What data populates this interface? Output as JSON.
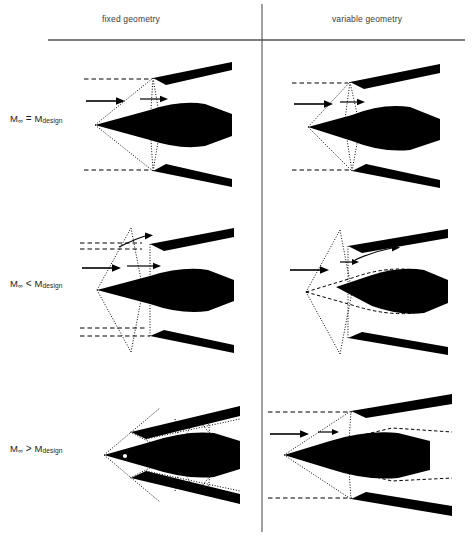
{
  "figure": {
    "columns": [
      {
        "id": "fixed",
        "label": "fixed geometry"
      },
      {
        "id": "variable",
        "label": "variable geometry"
      }
    ],
    "rows": [
      {
        "id": "design",
        "symbol": "M",
        "subscript": "∞",
        "operator": "=",
        "reference": "M",
        "reference_subscript": "design"
      },
      {
        "id": "below",
        "symbol": "M",
        "subscript": "∞",
        "operator": "<",
        "reference": "M",
        "reference_subscript": "design"
      },
      {
        "id": "above",
        "symbol": "M",
        "subscript": "∞",
        "operator": ">",
        "reference": "M",
        "reference_subscript": "design"
      }
    ],
    "row_labels": [
      "M∞ = Mdesign",
      "M∞ < Mdesign",
      "M∞ > Mdesign"
    ],
    "separators": {
      "vertical_x": 262,
      "horizontal_y": 40,
      "horizontal_x_start": 48,
      "horizontal_x_end": 465,
      "color": "#555555"
    },
    "colors": {
      "ink": "#000000",
      "body_fill": "#000000",
      "rule": "#555555",
      "header_text": "#3a3a3a",
      "label_text": "#1d1d1d",
      "background": "#ffffff"
    },
    "line_styles": {
      "shock_wave": "dotted",
      "freestream_streamline": "dashed",
      "ghost_original_position": "dashed",
      "flow_direction": "solid-arrow"
    },
    "cells": [
      {
        "row": "design",
        "column": "fixed",
        "description": "Oblique shock from centerbody tip impinges exactly on the cowl lip; shocks captured, no spillage.",
        "shock_on_lip": true,
        "spillage": false,
        "centerbody_translated": false
      },
      {
        "row": "design",
        "column": "variable",
        "description": "Oblique shock from centerbody tip impinges exactly on the cowl lip; shocks captured, no spillage.",
        "shock_on_lip": true,
        "spillage": false,
        "centerbody_translated": false
      },
      {
        "row": "below",
        "column": "fixed",
        "description": "Shock angle steepens, shock falls ahead of the cowl lip, flow spills around the cowl.",
        "shock_on_lip": false,
        "spillage": true,
        "centerbody_translated": false
      },
      {
        "row": "below",
        "column": "variable",
        "description": "Centerbody retracted aft so the steeper shock is repositioned back onto the cowl lip; spillage reduced.",
        "shock_on_lip": true,
        "spillage": true,
        "centerbody_translated": true
      },
      {
        "row": "above",
        "column": "fixed",
        "description": "Shock angle flattens, shock passes inside the cowl and reflects internally off the duct walls.",
        "shock_on_lip": false,
        "spillage": false,
        "centerbody_translated": false
      },
      {
        "row": "above",
        "column": "variable",
        "description": "Centerbody extended forward so the flatter shock is realigned on the cowl lip; internal reflections avoided.",
        "shock_on_lip": true,
        "spillage": false,
        "centerbody_translated": true
      }
    ]
  }
}
